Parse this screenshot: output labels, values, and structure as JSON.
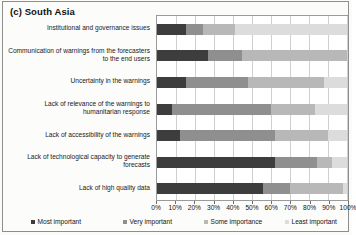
{
  "panel": {
    "title": "(c) South Asia"
  },
  "chart_data": {
    "type": "bar",
    "orientation": "horizontal",
    "stacked": true,
    "normalized_percent": true,
    "title": "(c) South Asia",
    "xlabel": "",
    "ylabel": "",
    "xlim": [
      0,
      100
    ],
    "xtick_labels": [
      "0%",
      "10%",
      "20%",
      "30%",
      "40%",
      "50%",
      "60%",
      "70%",
      "80%",
      "90%",
      "100%"
    ],
    "xtick_values": [
      0,
      10,
      20,
      30,
      40,
      50,
      60,
      70,
      80,
      90,
      100
    ],
    "grid": true,
    "grid_axis": "x",
    "legend_position": "bottom",
    "categories": [
      "Institutional and governance issues",
      "Communication of warnings from the forecasters to the end users",
      "Uncertainty in the warnings",
      "Lack of relevance of the warnings to humanitarian response",
      "Lack of accessibility of the warnings",
      "Lack of technological capacity to generate forecasts",
      "Lack of high quality data"
    ],
    "series": [
      {
        "name": "Most important",
        "color": "#3d3d3d",
        "values": [
          15,
          27,
          15,
          8,
          12,
          62,
          56
        ]
      },
      {
        "name": "Very important",
        "color": "#8f8f8f",
        "values": [
          9,
          18,
          33,
          52,
          50,
          22,
          14
        ]
      },
      {
        "name": "Some importance",
        "color": "#b8b8b8",
        "values": [
          17,
          55,
          40,
          23,
          28,
          8,
          28
        ]
      },
      {
        "name": "Least important",
        "color": "#dcdcdc",
        "values": [
          59,
          0,
          12,
          17,
          10,
          8,
          2
        ]
      }
    ]
  }
}
